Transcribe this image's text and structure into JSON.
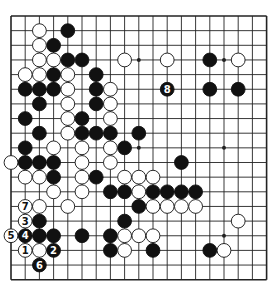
{
  "diagram": {
    "type": "go-board",
    "size": 19,
    "colors": {
      "background": "#ffffff",
      "line": "#222222",
      "black": "#111111",
      "white": "#ffffff"
    },
    "star_points": [
      [
        3,
        3
      ],
      [
        9,
        3
      ],
      [
        15,
        3
      ],
      [
        3,
        9
      ],
      [
        9,
        9
      ],
      [
        15,
        9
      ],
      [
        3,
        15
      ],
      [
        9,
        15
      ],
      [
        15,
        15
      ]
    ],
    "black_stones": [
      [
        4,
        1
      ],
      [
        3,
        2
      ],
      [
        4,
        3
      ],
      [
        5,
        3
      ],
      [
        14,
        3
      ],
      [
        3,
        4
      ],
      [
        6,
        4
      ],
      [
        1,
        5
      ],
      [
        2,
        5
      ],
      [
        3,
        5
      ],
      [
        6,
        5
      ],
      [
        14,
        5
      ],
      [
        16,
        5
      ],
      [
        2,
        6
      ],
      [
        6,
        6
      ],
      [
        1,
        7
      ],
      [
        5,
        7
      ],
      [
        2,
        8
      ],
      [
        5,
        8
      ],
      [
        6,
        8
      ],
      [
        7,
        8
      ],
      [
        9,
        8
      ],
      [
        1,
        9
      ],
      [
        8,
        9
      ],
      [
        1,
        10
      ],
      [
        2,
        10
      ],
      [
        3,
        10
      ],
      [
        12,
        10
      ],
      [
        3,
        11
      ],
      [
        6,
        11
      ],
      [
        7,
        12
      ],
      [
        8,
        12
      ],
      [
        10,
        12
      ],
      [
        11,
        12
      ],
      [
        12,
        12
      ],
      [
        13,
        12
      ],
      [
        9,
        13
      ],
      [
        2,
        14
      ],
      [
        8,
        14
      ],
      [
        2,
        15
      ],
      [
        3,
        15
      ],
      [
        5,
        15
      ],
      [
        7,
        15
      ],
      [
        7,
        16
      ],
      [
        10,
        16
      ],
      [
        14,
        16
      ]
    ],
    "white_stones": [
      [
        2,
        1
      ],
      [
        2,
        2
      ],
      [
        2,
        3
      ],
      [
        3,
        3
      ],
      [
        8,
        3
      ],
      [
        11,
        3
      ],
      [
        16,
        3
      ],
      [
        1,
        4
      ],
      [
        2,
        4
      ],
      [
        4,
        4
      ],
      [
        4,
        5
      ],
      [
        7,
        5
      ],
      [
        4,
        6
      ],
      [
        7,
        6
      ],
      [
        4,
        7
      ],
      [
        7,
        7
      ],
      [
        4,
        8
      ],
      [
        3,
        9
      ],
      [
        5,
        9
      ],
      [
        7,
        9
      ],
      [
        0,
        10
      ],
      [
        5,
        10
      ],
      [
        7,
        10
      ],
      [
        1,
        11
      ],
      [
        2,
        11
      ],
      [
        5,
        11
      ],
      [
        8,
        11
      ],
      [
        9,
        11
      ],
      [
        10,
        11
      ],
      [
        3,
        12
      ],
      [
        5,
        12
      ],
      [
        9,
        12
      ],
      [
        2,
        13
      ],
      [
        4,
        13
      ],
      [
        10,
        13
      ],
      [
        11,
        13
      ],
      [
        12,
        13
      ],
      [
        13,
        13
      ],
      [
        16,
        14
      ],
      [
        8,
        15
      ],
      [
        9,
        15
      ],
      [
        10,
        15
      ],
      [
        2,
        16
      ],
      [
        8,
        16
      ],
      [
        15,
        16
      ]
    ],
    "numbered_moves": [
      {
        "n": "1",
        "color": "white",
        "pos": [
          1,
          16
        ]
      },
      {
        "n": "2",
        "color": "black",
        "pos": [
          3,
          16
        ]
      },
      {
        "n": "3",
        "color": "white",
        "pos": [
          1,
          14
        ]
      },
      {
        "n": "4",
        "color": "black",
        "pos": [
          1,
          15
        ]
      },
      {
        "n": "5",
        "color": "white",
        "pos": [
          0,
          15
        ]
      },
      {
        "n": "6",
        "color": "black",
        "pos": [
          2,
          17
        ]
      },
      {
        "n": "7",
        "color": "white",
        "pos": [
          1,
          13
        ]
      },
      {
        "n": "8",
        "color": "black",
        "pos": [
          11,
          5
        ]
      }
    ]
  }
}
